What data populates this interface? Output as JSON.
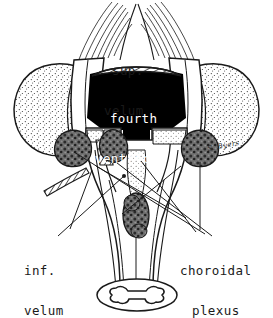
{
  "figure": {
    "background_color": "#ffffff",
    "ink_color": "#1a1a1a",
    "ventricle_fill": "#000000",
    "plexus_fill": "#6b6b6b",
    "stipple_color": "#3a3a3a"
  },
  "labels": {
    "sup_velum": {
      "line1": "sup.",
      "line2": "velum"
    },
    "fourth_ventricle": {
      "line1": "fourth",
      "line2": "ventricle"
    },
    "inf_velum": {
      "line1": "inf.",
      "line2": "velum"
    },
    "choroidal_plexus": {
      "line1": "choroidal",
      "line2": "plexus"
    },
    "signature": "S. Byers"
  },
  "structures": [
    {
      "name": "superior-medullary-velum",
      "style": "hatched-arc"
    },
    {
      "name": "fourth-ventricle",
      "style": "solid-black-cavity"
    },
    {
      "name": "cerebellar-hemisphere-left",
      "style": "stippled-lobe"
    },
    {
      "name": "cerebellar-hemisphere-right",
      "style": "stippled-lobe"
    },
    {
      "name": "superior-cerebellar-peduncle-fibers",
      "style": "fanned-lines"
    },
    {
      "name": "choroid-plexus-left-recess",
      "style": "mottled-mass"
    },
    {
      "name": "choroid-plexus-right-recess",
      "style": "mottled-mass"
    },
    {
      "name": "choroid-plexus-midline",
      "style": "mottled-mass"
    },
    {
      "name": "inferior-medullary-velum",
      "style": "hatched-band"
    },
    {
      "name": "spinal-cord-cross-section",
      "style": "butterfly-grey-matter"
    }
  ]
}
